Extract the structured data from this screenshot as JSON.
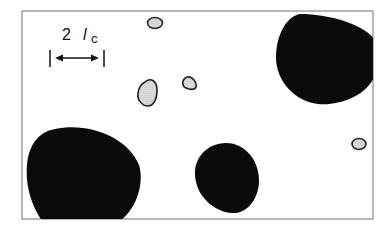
{
  "diagram": {
    "scale_label": {
      "number": "2",
      "symbol": "l",
      "subscript": "c"
    },
    "colors": {
      "frame": "#707070",
      "dark_particle": "#0a0a0a",
      "small_particle_fill": "#dcdcdc",
      "small_particle_stroke": "#222222"
    },
    "large_particles": 4,
    "small_particles": 5
  }
}
